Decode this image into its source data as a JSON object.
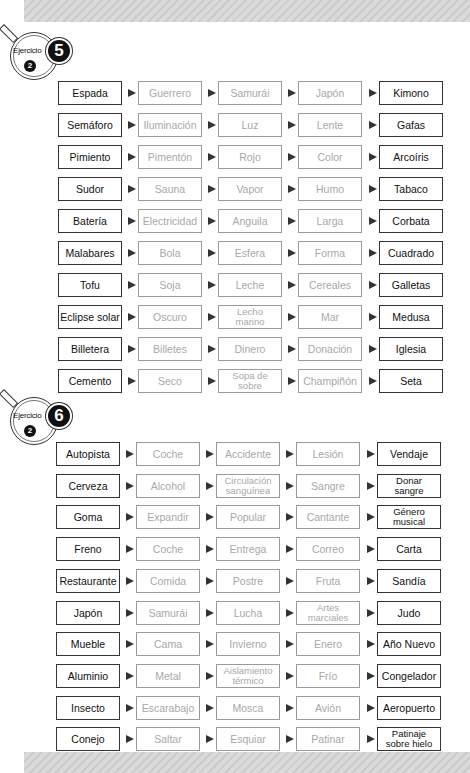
{
  "exercises": [
    {
      "badge_label": "Ejercicio",
      "number": "5",
      "level": "2",
      "rows": [
        [
          "Espada",
          "Guerrero",
          "Samurái",
          "Japón",
          "Kimono"
        ],
        [
          "Semáforo",
          "Iluminación",
          "Luz",
          "Lente",
          "Gafas"
        ],
        [
          "Pimiento",
          "Pimentón",
          "Rojo",
          "Color",
          "Arcoíris"
        ],
        [
          "Sudor",
          "Sauna",
          "Vapor",
          "Humo",
          "Tabaco"
        ],
        [
          "Batería",
          "Electricidad",
          "Anguila",
          "Larga",
          "Corbata"
        ],
        [
          "Malabares",
          "Bola",
          "Esfera",
          "Forma",
          "Cuadrado"
        ],
        [
          "Tofu",
          "Soja",
          "Leche",
          "Cereales",
          "Galletas"
        ],
        [
          "Eclipse solar",
          "Oscuro",
          "Lecho\nmarino",
          "Mar",
          "Medusa"
        ],
        [
          "Billetera",
          "Billetes",
          "Dinero",
          "Donación",
          "Iglesia"
        ],
        [
          "Cemento",
          "Seco",
          "Sopa de\nsobre",
          "Champiñón",
          "Seta"
        ]
      ]
    },
    {
      "badge_label": "Ejercicio",
      "number": "6",
      "level": "2",
      "rows": [
        [
          "Autopista",
          "Coche",
          "Accidente",
          "Lesión",
          "Vendaje"
        ],
        [
          "Cerveza",
          "Alcohol",
          "Circulación\nsanguínea",
          "Sangre",
          "Donar\nsangre"
        ],
        [
          "Goma",
          "Expandir",
          "Popular",
          "Cantante",
          "Género\nmusical"
        ],
        [
          "Freno",
          "Coche",
          "Entrega",
          "Correo",
          "Carta"
        ],
        [
          "Restaurante",
          "Comida",
          "Postre",
          "Fruta",
          "Sandía"
        ],
        [
          "Japón",
          "Samurái",
          "Lucha",
          "Artes\nmarciales",
          "Judo"
        ],
        [
          "Mueble",
          "Cama",
          "Invierno",
          "Enero",
          "Año Nuevo"
        ],
        [
          "Aluminio",
          "Metal",
          "Aislamiento\ntérmico",
          "Frío",
          "Congelador"
        ],
        [
          "Insecto",
          "Escarabajo",
          "Mosca",
          "Avión",
          "Aeropuerto"
        ],
        [
          "Conejo",
          "Saltar",
          "Esquiar",
          "Patinar",
          "Patinaje\nsobre hielo"
        ]
      ]
    }
  ],
  "colors": {
    "given_text": "#111111",
    "blank_text": "#a8a8a8",
    "band": "#d4d4d4"
  }
}
